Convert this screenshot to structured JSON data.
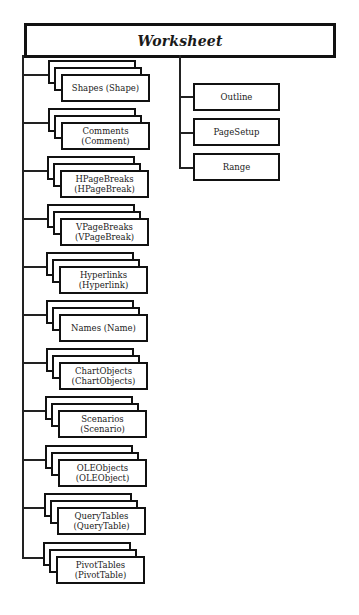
{
  "diagram": {
    "root": {
      "label": "Worksheet"
    },
    "collections": [
      {
        "line1": "Shapes (Shape)",
        "line2": ""
      },
      {
        "line1": "Comments",
        "line2": "(Comment)"
      },
      {
        "line1": "HPageBreaks",
        "line2": "(HPageBreak)"
      },
      {
        "line1": "VPageBreaks",
        "line2": "(VPageBreak)"
      },
      {
        "line1": "Hyperlinks",
        "line2": "(Hyperlink)"
      },
      {
        "line1": "Names (Name)",
        "line2": ""
      },
      {
        "line1": "ChartObjects",
        "line2": "(ChartObjects)"
      },
      {
        "line1": "Scenarios",
        "line2": "(Scenario)"
      },
      {
        "line1": "OLEObjects",
        "line2": "(OLEObject)"
      },
      {
        "line1": "QueryTables",
        "line2": "(QueryTable)"
      },
      {
        "line1": "PivotTables",
        "line2": "(PivotTable)"
      }
    ],
    "objects": [
      {
        "label": "Outline"
      },
      {
        "label": "PageSetup"
      },
      {
        "label": "Range"
      }
    ],
    "colors": {
      "stroke": "#111111",
      "fill": "#ffffff",
      "text": "#222222"
    }
  }
}
